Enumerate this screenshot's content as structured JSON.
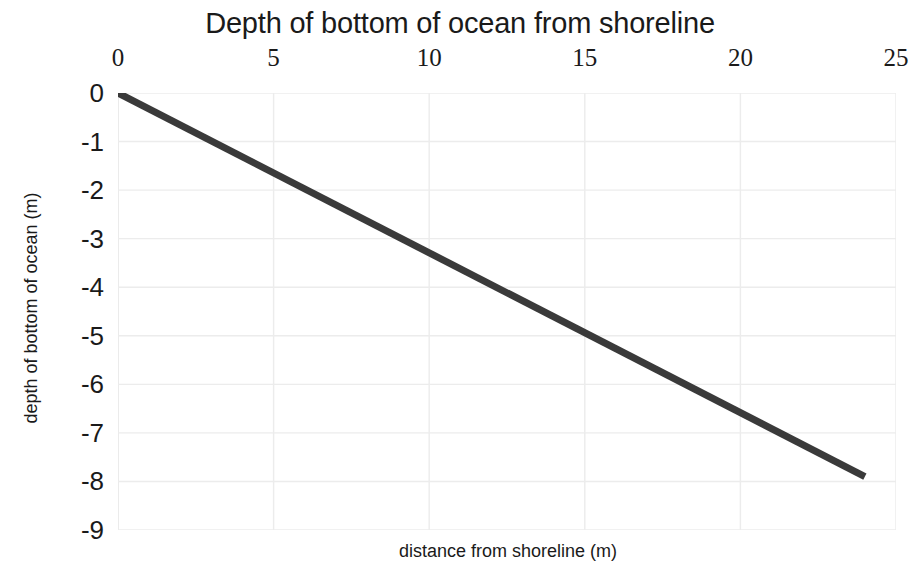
{
  "chart_data": {
    "type": "line",
    "title": "Depth of bottom of ocean from shoreline",
    "xlabel": "distance from shoreline (m)",
    "ylabel": "depth of bottom of ocean (m)",
    "xlabel_position": "bottom",
    "xaxis_ticks_position": "top",
    "grid": true,
    "legend": false,
    "xlim": [
      0,
      25
    ],
    "ylim": [
      -9,
      0
    ],
    "xticks": [
      0,
      5,
      10,
      15,
      20,
      25
    ],
    "xtick_labels": [
      "0",
      "5",
      "10",
      "15",
      "20",
      "25"
    ],
    "yticks": [
      0,
      -1,
      -2,
      -3,
      -4,
      -5,
      -6,
      -7,
      -8,
      -9
    ],
    "ytick_labels": [
      "0",
      "-1",
      "-2",
      "-3",
      "-4",
      "-5",
      "-6",
      "-7",
      "-8",
      "-9"
    ],
    "series": [
      {
        "name": "ocean floor",
        "color": "#3a3a3a",
        "line_width": 7,
        "x": [
          0,
          24
        ],
        "y": [
          0,
          -7.9
        ],
        "slope": -0.33,
        "intercept": 0,
        "points": [
          {
            "x": 0,
            "y": 0
          },
          {
            "x": 5,
            "y": -1.65
          },
          {
            "x": 10,
            "y": -3.3
          },
          {
            "x": 15,
            "y": -4.94
          },
          {
            "x": 20,
            "y": -6.58
          },
          {
            "x": 24,
            "y": -7.9
          }
        ]
      }
    ]
  },
  "style": {
    "background": "#ffffff",
    "text_color": "#1a1a1a",
    "grid_color": "#ececec",
    "axis_color": "#e2e2e2",
    "line_color": "#3a3a3a"
  }
}
